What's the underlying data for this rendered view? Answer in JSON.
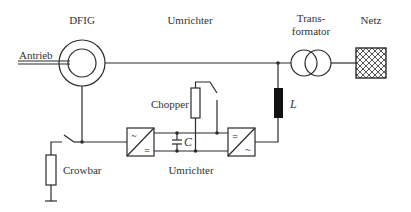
{
  "diagram": {
    "labels": {
      "dfig": "DFIG",
      "antrieb": "Antrieb",
      "umrichter_top": "Umrichter",
      "transformator_line1": "Trans-",
      "transformator_line2": "formator",
      "netz": "Netz",
      "chopper": "Chopper",
      "inductor": "L",
      "capacitor": "C",
      "crowbar": "Crowbar",
      "umrichter_bottom": "Umrichter"
    },
    "converter_symbols": {
      "ac": "~",
      "dc": "="
    },
    "colors": {
      "line": "#2b2b2b",
      "text": "#333333",
      "inductor_fill": "#111111",
      "background": "#ffffff"
    }
  }
}
